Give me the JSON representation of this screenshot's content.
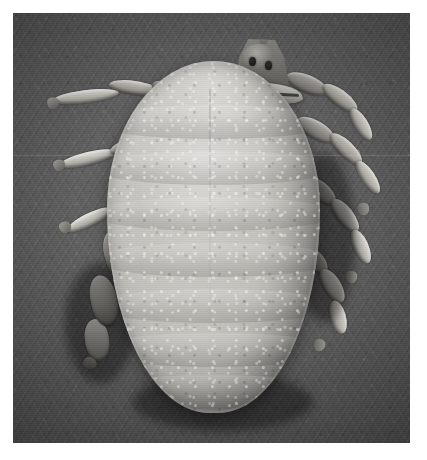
{
  "figure": {
    "kind": "scanning-electron-micrograph",
    "view": "dorsal",
    "color_mode": "grayscale",
    "caption": "",
    "border_color": "#ffffff",
    "background_color": "#5a5a5a",
    "body_color": "#c4c2bd",
    "capitulum_color": "#7b7975",
    "leg_color": "#b0ada8"
  },
  "plate": {
    "border_width_px": 13,
    "content_width_px": 397,
    "content_height_px": 430
  },
  "specimen": {
    "body": {
      "name": "idiosoma",
      "label": "",
      "ridge_count": 7
    },
    "capitulum": {
      "name": "capitulum",
      "label": "",
      "palp_count": 2
    },
    "legs": [
      {
        "side": "left",
        "index": 1,
        "label": ""
      },
      {
        "side": "left",
        "index": 2,
        "label": ""
      },
      {
        "side": "left",
        "index": 3,
        "label": ""
      },
      {
        "side": "left",
        "index": 4,
        "label": ""
      },
      {
        "side": "right",
        "index": 1,
        "label": ""
      },
      {
        "side": "right",
        "index": 2,
        "label": ""
      },
      {
        "side": "right",
        "index": 3,
        "label": ""
      },
      {
        "side": "right",
        "index": 4,
        "label": ""
      }
    ]
  },
  "overlays": {
    "scale_bar_text": "",
    "magnification_text": "",
    "annotations": []
  }
}
